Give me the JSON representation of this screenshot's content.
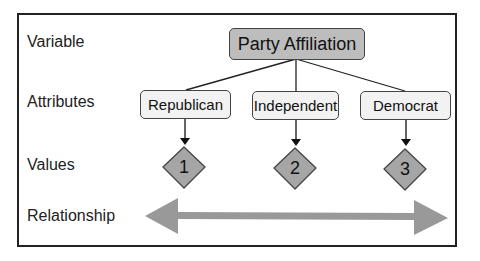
{
  "row_labels": {
    "variable": "Variable",
    "attributes": "Attributes",
    "values": "Values",
    "relationship": "Relationship"
  },
  "variable": {
    "label": "Party Affiliation"
  },
  "attributes": [
    {
      "label": "Republican"
    },
    {
      "label": "Independent"
    },
    {
      "label": "Democrat"
    }
  ],
  "values": [
    {
      "label": "1"
    },
    {
      "label": "2"
    },
    {
      "label": "3"
    }
  ],
  "colors": {
    "variable_fill": "#bdbdbd",
    "attribute_fill": "#f2f2f2",
    "diamond_fill": "#a6a6a6",
    "arrow_fill": "#999999",
    "border": "#222222"
  }
}
